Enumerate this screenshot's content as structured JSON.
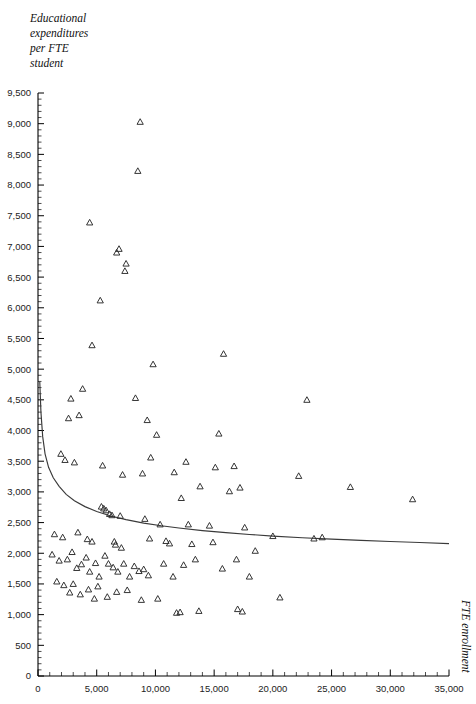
{
  "chart_data": {
    "type": "scatter",
    "title": "",
    "ylabel": "Educational expenditures per FTE student",
    "xlabel": "FTE enrollment",
    "xlim": [
      0,
      35000
    ],
    "ylim": [
      0,
      9500
    ],
    "grid": false,
    "legend": null,
    "marker_shape": "open-triangle",
    "x_ticks": [
      0,
      5000,
      10000,
      15000,
      20000,
      25000,
      30000,
      35000
    ],
    "x_tick_labels": [
      "0",
      "5,000",
      "10,000",
      "15,000",
      "20,000",
      "25,000",
      "30,000",
      "35,000"
    ],
    "x_minor_step": 1000,
    "y_ticks": [
      0,
      500,
      1000,
      1500,
      2000,
      2500,
      3000,
      3500,
      4000,
      4500,
      5000,
      5500,
      6000,
      6500,
      7000,
      7500,
      8000,
      8500,
      9000,
      9500
    ],
    "y_tick_labels": [
      "0",
      "500",
      "1,000",
      "1,500",
      "2,000",
      "2,500",
      "3,000",
      "3,500",
      "4,000",
      "4,500",
      "5,000",
      "5,500",
      "6,000",
      "6,500",
      "7,000",
      "7,500",
      "8,000",
      "8,500",
      "9,000",
      "9,500"
    ],
    "y_minor_step": 100,
    "fit_curve": {
      "description": "decreasing hyperbolic fit of expenditures vs enrollment",
      "points": [
        [
          150,
          4800
        ],
        [
          250,
          4300
        ],
        [
          400,
          3900
        ],
        [
          600,
          3620
        ],
        [
          900,
          3400
        ],
        [
          1300,
          3230
        ],
        [
          1800,
          3090
        ],
        [
          2400,
          2960
        ],
        [
          3100,
          2855
        ],
        [
          4000,
          2760
        ],
        [
          5000,
          2680
        ],
        [
          6200,
          2608
        ],
        [
          7500,
          2548
        ],
        [
          9000,
          2492
        ],
        [
          10500,
          2448
        ],
        [
          12000,
          2412
        ],
        [
          14000,
          2370
        ],
        [
          16000,
          2336
        ],
        [
          18000,
          2306
        ],
        [
          20000,
          2280
        ],
        [
          22500,
          2253
        ],
        [
          25000,
          2230
        ],
        [
          27500,
          2210
        ],
        [
          30000,
          2192
        ],
        [
          32500,
          2175
        ],
        [
          35000,
          2158
        ]
      ]
    },
    "points": [
      [
        8700,
        9030
      ],
      [
        8500,
        8230
      ],
      [
        4400,
        7390
      ],
      [
        6900,
        6960
      ],
      [
        6700,
        6900
      ],
      [
        7500,
        6720
      ],
      [
        7400,
        6600
      ],
      [
        5300,
        6120
      ],
      [
        4600,
        5390
      ],
      [
        15800,
        5250
      ],
      [
        9800,
        5080
      ],
      [
        22900,
        4500
      ],
      [
        8300,
        4530
      ],
      [
        3800,
        4680
      ],
      [
        2800,
        4520
      ],
      [
        3500,
        4250
      ],
      [
        2600,
        4200
      ],
      [
        9300,
        4170
      ],
      [
        10100,
        3930
      ],
      [
        15400,
        3950
      ],
      [
        1950,
        3620
      ],
      [
        2300,
        3520
      ],
      [
        3100,
        3480
      ],
      [
        5500,
        3430
      ],
      [
        9600,
        3560
      ],
      [
        12600,
        3490
      ],
      [
        15100,
        3400
      ],
      [
        16700,
        3420
      ],
      [
        7200,
        3280
      ],
      [
        8900,
        3300
      ],
      [
        11600,
        3320
      ],
      [
        13800,
        3090
      ],
      [
        17200,
        3070
      ],
      [
        22200,
        3260
      ],
      [
        26600,
        3080
      ],
      [
        31900,
        2880
      ],
      [
        12200,
        2900
      ],
      [
        16300,
        3010
      ],
      [
        5400,
        2760
      ],
      [
        5600,
        2730
      ],
      [
        5800,
        2700
      ],
      [
        6100,
        2640
      ],
      [
        6300,
        2620
      ],
      [
        7000,
        2610
      ],
      [
        9100,
        2560
      ],
      [
        10400,
        2470
      ],
      [
        12800,
        2470
      ],
      [
        14600,
        2450
      ],
      [
        17600,
        2420
      ],
      [
        3400,
        2340
      ],
      [
        1400,
        2310
      ],
      [
        2100,
        2260
      ],
      [
        4200,
        2230
      ],
      [
        4600,
        2190
      ],
      [
        6500,
        2190
      ],
      [
        6600,
        2140
      ],
      [
        7100,
        2090
      ],
      [
        9500,
        2240
      ],
      [
        10900,
        2200
      ],
      [
        11200,
        2160
      ],
      [
        13100,
        2150
      ],
      [
        14900,
        2180
      ],
      [
        18500,
        2040
      ],
      [
        20000,
        2280
      ],
      [
        23500,
        2240
      ],
      [
        24200,
        2260
      ],
      [
        1200,
        1980
      ],
      [
        1800,
        1880
      ],
      [
        2500,
        1900
      ],
      [
        2900,
        2020
      ],
      [
        3300,
        1760
      ],
      [
        3700,
        1820
      ],
      [
        4100,
        1930
      ],
      [
        4400,
        1700
      ],
      [
        4900,
        1840
      ],
      [
        5200,
        1620
      ],
      [
        5700,
        1960
      ],
      [
        6000,
        1830
      ],
      [
        6400,
        1770
      ],
      [
        6800,
        1700
      ],
      [
        7300,
        1830
      ],
      [
        7800,
        1620
      ],
      [
        8200,
        1790
      ],
      [
        8600,
        1710
      ],
      [
        9000,
        1740
      ],
      [
        9400,
        1640
      ],
      [
        10700,
        1830
      ],
      [
        11500,
        1620
      ],
      [
        12400,
        1810
      ],
      [
        13400,
        1900
      ],
      [
        15700,
        1750
      ],
      [
        16900,
        1900
      ],
      [
        18000,
        1620
      ],
      [
        1600,
        1540
      ],
      [
        2200,
        1480
      ],
      [
        2700,
        1360
      ],
      [
        3000,
        1500
      ],
      [
        3600,
        1330
      ],
      [
        4300,
        1410
      ],
      [
        4800,
        1260
      ],
      [
        5100,
        1460
      ],
      [
        5900,
        1290
      ],
      [
        6700,
        1370
      ],
      [
        7600,
        1400
      ],
      [
        8800,
        1240
      ],
      [
        10200,
        1260
      ],
      [
        11800,
        1030
      ],
      [
        12100,
        1040
      ],
      [
        13700,
        1060
      ],
      [
        17000,
        1090
      ],
      [
        17400,
        1050
      ],
      [
        20600,
        1280
      ]
    ]
  }
}
